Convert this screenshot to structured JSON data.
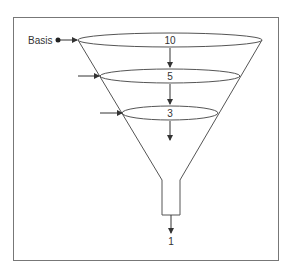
{
  "diagram": {
    "type": "funnel",
    "basis_label": "Basis",
    "stages": [
      {
        "label": "10"
      },
      {
        "label": "5"
      },
      {
        "label": "3"
      }
    ],
    "output_label": "1",
    "colors": {
      "line": "#555555",
      "frame": "#777777",
      "text": "#333333"
    }
  }
}
